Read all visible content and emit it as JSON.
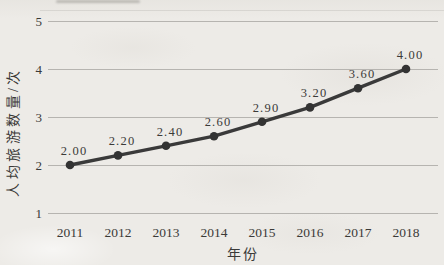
{
  "page": {
    "background_color": "#edebe7",
    "text_color": "#3b3a38"
  },
  "chart_data": {
    "type": "line",
    "title": "",
    "xlabel": "年份",
    "ylabel": "人均旅游数量/次",
    "categories": [
      "2011",
      "2012",
      "2013",
      "2014",
      "2015",
      "2016",
      "2017",
      "2018"
    ],
    "values": [
      2.0,
      2.2,
      2.4,
      2.6,
      2.9,
      3.2,
      3.6,
      4.0
    ],
    "point_labels": [
      "2.00",
      "2.20",
      "2.40",
      "2.60",
      "2.90",
      "3.20",
      "3.60",
      "4.00"
    ],
    "yticks": [
      1,
      2,
      3,
      4,
      5
    ],
    "ylim": [
      1,
      5
    ],
    "grid": true,
    "legend": false,
    "line_color": "#3a3a3a",
    "marker_color": "#333333",
    "gridline_color": "#b6b4b0"
  }
}
